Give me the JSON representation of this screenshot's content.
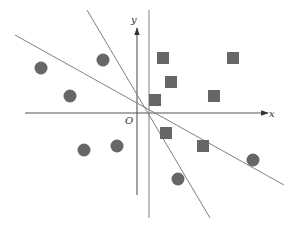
{
  "diagram": {
    "title": "",
    "axes": {
      "x_label": "x",
      "y_label": "y",
      "origin_label": "O"
    },
    "colors": {
      "background": "#ffffff",
      "line": "#808080",
      "axis": "#555555",
      "marker": "#666666"
    },
    "classes": [
      {
        "name": "circles",
        "shape": "circle",
        "points": [
          [
            41,
            68
          ],
          [
            103,
            60
          ],
          [
            70,
            96
          ],
          [
            84,
            150
          ],
          [
            117,
            146
          ],
          [
            178,
            179
          ],
          [
            253,
            160
          ]
        ]
      },
      {
        "name": "squares",
        "shape": "square",
        "points": [
          [
            163,
            58
          ],
          [
            233,
            58
          ],
          [
            171,
            82
          ],
          [
            155,
            100
          ],
          [
            214,
            96
          ],
          [
            166,
            133
          ],
          [
            203,
            146
          ]
        ]
      }
    ],
    "separating_lines": [
      {
        "name": "line-shallow",
        "from": [
          15,
          35
        ],
        "to": [
          284,
          185
        ]
      },
      {
        "name": "line-steep",
        "from": [
          87,
          10
        ],
        "to": [
          210,
          218
        ]
      },
      {
        "name": "line-vertical",
        "from": [
          149,
          10
        ],
        "to": [
          149,
          218
        ]
      }
    ]
  }
}
